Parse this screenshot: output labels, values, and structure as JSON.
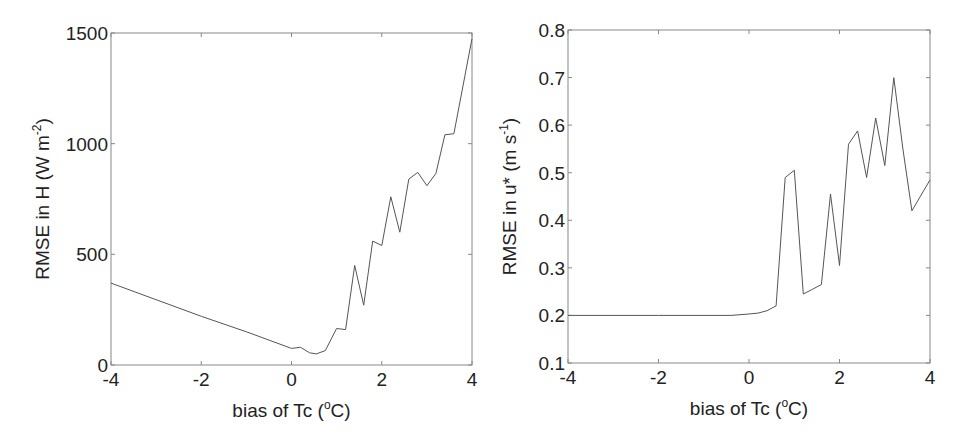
{
  "chart_data": [
    {
      "type": "line",
      "title": "",
      "xlabel": "bias of Tc (oC)",
      "xlabel_parts": {
        "main": "bias of Tc (",
        "sup": "o",
        "tail": "C)"
      },
      "ylabel": "RMSE in H (W m-2)",
      "ylabel_parts": {
        "main": "RMSE in H (W m",
        "sup": "-2",
        "tail": ")"
      },
      "xlim": [
        -4,
        4
      ],
      "ylim": [
        0,
        1500
      ],
      "xticks": [
        -4,
        -2,
        0,
        2,
        4
      ],
      "yticks": [
        0,
        500,
        1000,
        1500
      ],
      "xtick_labels": [
        "-4",
        "-2",
        "0",
        "2",
        "4"
      ],
      "ytick_labels": [
        "0",
        "500",
        "1000",
        "1500"
      ],
      "grid": false,
      "legend": null,
      "line_color": "#555555",
      "series": [
        {
          "name": "RMSE in H",
          "x": [
            -4,
            -3,
            -2,
            -1,
            0,
            0.2,
            0.4,
            0.55,
            0.75,
            1.0,
            1.2,
            1.4,
            1.6,
            1.8,
            2.0,
            2.2,
            2.4,
            2.6,
            2.8,
            3.0,
            3.2,
            3.4,
            3.6,
            4.0
          ],
          "y": [
            370,
            295,
            220,
            150,
            75,
            80,
            55,
            50,
            65,
            165,
            160,
            450,
            270,
            560,
            540,
            760,
            600,
            840,
            870,
            810,
            865,
            1040,
            1045,
            1475
          ]
        }
      ]
    },
    {
      "type": "line",
      "title": "",
      "xlabel": "bias of Tc (oC)",
      "xlabel_parts": {
        "main": "bias of Tc (",
        "sup": "o",
        "tail": "C)"
      },
      "ylabel": "RMSE in u* (m s-1)",
      "ylabel_parts": {
        "main": "RMSE in u* (m s",
        "sup": "-1",
        "tail": ")"
      },
      "xlim": [
        -4,
        4
      ],
      "ylim": [
        0.1,
        0.8
      ],
      "xticks": [
        -4,
        -2,
        0,
        2,
        4
      ],
      "yticks": [
        0.1,
        0.2,
        0.3,
        0.4,
        0.5,
        0.6,
        0.7,
        0.8
      ],
      "xtick_labels": [
        "-4",
        "-2",
        "0",
        "2",
        "4"
      ],
      "ytick_labels": [
        "0.1",
        "0.2",
        "0.3",
        "0.4",
        "0.5",
        "0.6",
        "0.7",
        "0.8"
      ],
      "grid": false,
      "legend": null,
      "line_color": "#555555",
      "series": [
        {
          "name": "RMSE in u*",
          "x": [
            -4,
            -2,
            -0.4,
            0,
            0.2,
            0.4,
            0.6,
            0.8,
            1.0,
            1.2,
            1.4,
            1.6,
            1.8,
            2.0,
            2.2,
            2.4,
            2.6,
            2.8,
            3.0,
            3.2,
            3.4,
            3.6,
            4.0
          ],
          "y": [
            0.2,
            0.2,
            0.2,
            0.203,
            0.205,
            0.21,
            0.22,
            0.49,
            0.505,
            0.245,
            0.255,
            0.265,
            0.455,
            0.305,
            0.56,
            0.588,
            0.49,
            0.615,
            0.515,
            0.7,
            0.55,
            0.42,
            0.485
          ]
        }
      ]
    }
  ],
  "panels": [
    {
      "box": {
        "left": 111,
        "top": 33,
        "right": 472,
        "bottom": 365
      }
    },
    {
      "box": {
        "left": 568,
        "top": 30,
        "right": 930,
        "bottom": 363
      }
    }
  ]
}
